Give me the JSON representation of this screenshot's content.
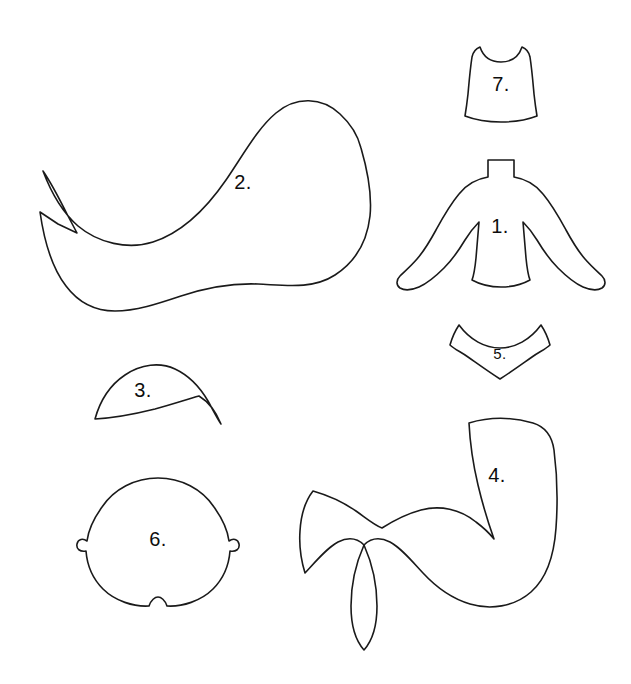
{
  "document": {
    "title": "Mermaid Doll Sewing Pattern Template",
    "description": "Line-art craft pattern sheet with seven numbered cut pieces",
    "width": 631,
    "height": 684,
    "background_color": "#ffffff",
    "stroke_color": "#1a1a1a",
    "label_color": "#0d0d0d"
  },
  "pieces": [
    {
      "id": "piece-1",
      "number": "1.",
      "name": "torso-with-arms",
      "label_x": 500,
      "label_y": 228,
      "label_size": "normal"
    },
    {
      "id": "piece-2",
      "number": "2.",
      "name": "long-hair",
      "label_x": 243,
      "label_y": 184,
      "label_size": "normal"
    },
    {
      "id": "piece-3",
      "number": "3.",
      "name": "hair-fringe",
      "label_x": 143,
      "label_y": 392,
      "label_size": "normal"
    },
    {
      "id": "piece-4",
      "number": "4.",
      "name": "mermaid-tail",
      "label_x": 497,
      "label_y": 477,
      "label_size": "normal"
    },
    {
      "id": "piece-5",
      "number": "5.",
      "name": "bikini-top",
      "label_x": 500,
      "label_y": 355,
      "label_size": "small"
    },
    {
      "id": "piece-6",
      "number": "6.",
      "name": "head",
      "label_x": 158,
      "label_y": 541,
      "label_size": "normal"
    },
    {
      "id": "piece-7",
      "number": "7.",
      "name": "vest-bodice",
      "label_x": 501,
      "label_y": 86,
      "label_size": "normal"
    }
  ]
}
